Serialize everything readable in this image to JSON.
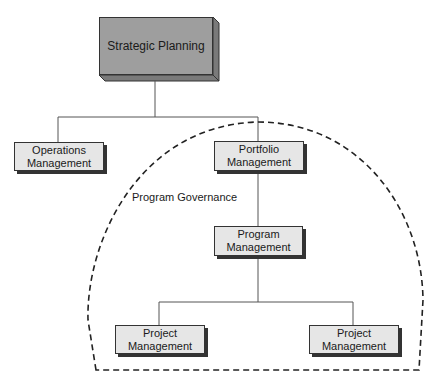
{
  "diagram": {
    "nodes": {
      "strategic": {
        "label": "Strategic Planning"
      },
      "operations": {
        "line1": "Operations",
        "line2": "Management"
      },
      "portfolio": {
        "line1": "Portfolio",
        "line2": "Management"
      },
      "program": {
        "line1": "Program",
        "line2": "Management"
      },
      "project_left": {
        "line1": "Project",
        "line2": "Management"
      },
      "project_right": {
        "line1": "Project",
        "line2": "Management"
      }
    },
    "region_label": "Program Governance",
    "colors": {
      "strategic_fill": "#9e9e9e",
      "box_fill": "#e6e6e6",
      "line": "#333333"
    }
  }
}
